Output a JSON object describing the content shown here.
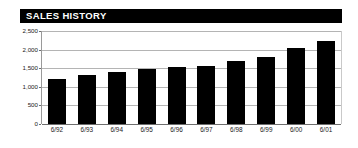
{
  "title": "SALES HISTORY",
  "colors": {
    "title_bar_bg": "#000000",
    "title_text": "#ffffff",
    "bar": "#000000",
    "gridline": "#b4b4b4",
    "axis": "#6e6e6e",
    "background": "#ffffff"
  },
  "chart_data": {
    "type": "bar",
    "title": "SALES HISTORY",
    "xlabel": "",
    "ylabel": "",
    "categories": [
      "6/92",
      "6/93",
      "6/94",
      "6/95",
      "6/96",
      "6/97",
      "6/98",
      "6/99",
      "6/00",
      "6/01"
    ],
    "values": [
      1220,
      1320,
      1390,
      1480,
      1520,
      1570,
      1690,
      1800,
      2040,
      2230
    ],
    "ylim": [
      0,
      2500
    ],
    "yticks": [
      0,
      500,
      1000,
      1500,
      2000,
      2500
    ],
    "ytick_labels": [
      "0",
      "500",
      "1,000",
      "1,500",
      "2,000",
      "2,500"
    ],
    "grid": true,
    "legend": null
  }
}
